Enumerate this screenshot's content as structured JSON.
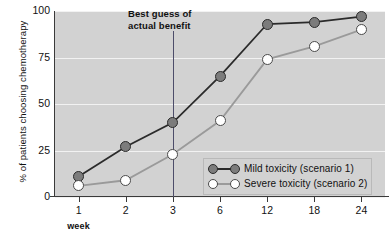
{
  "chart_data": {
    "type": "line",
    "title": "",
    "xlabel": "week",
    "ylabel": "% of patients choosing chemotherapy",
    "categories": [
      "1",
      "2",
      "3",
      "6",
      "12",
      "18",
      "24"
    ],
    "xtick_labels": [
      "1",
      "2",
      "3",
      "6",
      "12",
      "18",
      "24"
    ],
    "ytick_labels": [
      "0",
      "25",
      "50",
      "75",
      "100"
    ],
    "ylim": [
      0,
      100
    ],
    "yticks": [
      0,
      25,
      50,
      75,
      100
    ],
    "grid": true,
    "grid_axis": "y",
    "legend_position": "inside-lower-right",
    "series": [
      {
        "name": "Mild toxicity (scenario 1)",
        "marker": "filled-circle",
        "color": "#7c7c7c",
        "line_color": "#2b2b2b",
        "values": [
          11,
          27,
          40,
          65,
          93,
          94,
          97
        ]
      },
      {
        "name": "Severe toxicity (scenario 2)",
        "marker": "open-circle",
        "color": "#ffffff",
        "line_color": "#9a9a9a",
        "values": [
          6,
          9,
          23,
          41,
          74,
          81,
          90
        ]
      }
    ],
    "annotations": [
      {
        "text_line_1": "Best guess of",
        "text_line_2": "actual benefit",
        "at_category": "3",
        "type": "vertical-line-with-label",
        "line_color": "#4d4d6a"
      }
    ]
  },
  "axis": {
    "y_title": "% of patients choosing chemotherapy",
    "x_title": "week"
  },
  "legend": {
    "entries": [
      {
        "label": "Mild toxicity (scenario 1)"
      },
      {
        "label": "Severe toxicity (scenario 2)"
      }
    ]
  },
  "annotation": {
    "line1": "Best guess of",
    "line2": "actual benefit"
  },
  "colors": {
    "plot_background": "#d2d2d2",
    "gridline": "#f2f2f2",
    "axis": "#3a3a3a",
    "mild_line": "#2b2b2b",
    "mild_marker": "#7c7c7c",
    "severe_line": "#9a9a9a",
    "severe_marker": "#ffffff",
    "annotation_line": "#4d4d6a"
  }
}
